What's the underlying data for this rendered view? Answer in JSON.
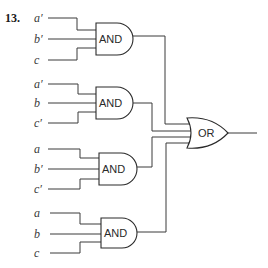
{
  "problem": {
    "number": "13."
  },
  "and_gates": [
    {
      "label": "AND",
      "inputs": [
        "a′",
        "b′",
        "c"
      ]
    },
    {
      "label": "AND",
      "inputs": [
        "a′",
        "b",
        "c′"
      ]
    },
    {
      "label": "AND",
      "inputs": [
        "a",
        "b′",
        "c′"
      ]
    },
    {
      "label": "AND",
      "inputs": [
        "a",
        "b",
        "c"
      ]
    }
  ],
  "or_gate": {
    "label": "OR"
  }
}
